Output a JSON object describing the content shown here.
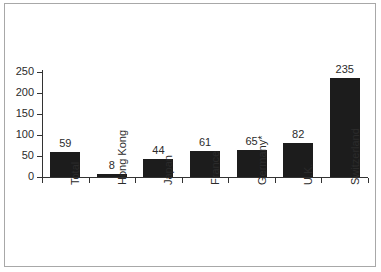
{
  "chart_data": {
    "type": "bar",
    "title": "",
    "subtitle": "",
    "xlabel": "",
    "ylabel": "",
    "categories": [
      "Total",
      "Hong Kong",
      "Japan",
      "France",
      "Germany*",
      "U.K.",
      "Switzerland"
    ],
    "values": [
      59,
      8,
      44,
      61,
      65,
      82,
      235
    ],
    "value_labels": [
      "59",
      "8",
      "44",
      "61",
      "65",
      "82",
      "235"
    ],
    "ylim": [
      0,
      250
    ],
    "yticks": [
      0,
      50,
      100,
      150,
      200,
      250
    ],
    "ytick_labels": [
      "0",
      "50",
      "100",
      "150",
      "200",
      "250"
    ],
    "grid": false,
    "legend": false,
    "legend_position": "none",
    "bar_color": "#1c1c1c",
    "axis_color": "#333333",
    "frame_color": "#a8a8a8",
    "background_color": "#ffffff",
    "text_color": "#2b2b2b",
    "category_label_rotation": -90,
    "annotations": [
      "Germany*"
    ]
  }
}
